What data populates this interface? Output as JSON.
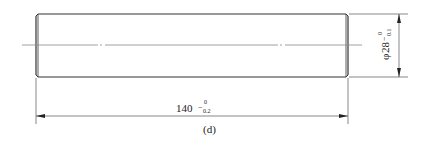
{
  "figure": {
    "label": "(d)",
    "part": "cylindrical shaft",
    "length_dimension": {
      "nominal": "140",
      "upper_tolerance": "0",
      "lower_tolerance": "-0.2"
    },
    "diameter_dimension": {
      "symbol": "φ",
      "nominal": "28",
      "upper_tolerance": "0",
      "lower_tolerance": "-0.1"
    },
    "colors": {
      "outline": "#333333",
      "thin_line": "#555555",
      "centerline": "#888888"
    }
  }
}
